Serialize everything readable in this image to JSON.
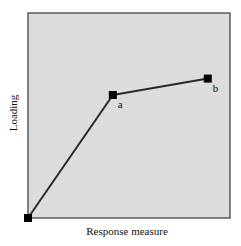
{
  "chart_data": {
    "type": "line",
    "title": "",
    "xlabel": "Response measure",
    "ylabel": "Loading",
    "xlim": [
      0,
      1
    ],
    "ylim": [
      0,
      1
    ],
    "grid": false,
    "legend": "none",
    "series": [
      {
        "name": "loading-path",
        "points": [
          {
            "x": 0.0,
            "y": 0.0,
            "label": ""
          },
          {
            "x": 0.42,
            "y": 0.6,
            "label": "a"
          },
          {
            "x": 0.89,
            "y": 0.68,
            "label": "b"
          }
        ]
      }
    ],
    "colors": {
      "background": "#dcdcdc",
      "frame": "#444444",
      "line": "#2a2a2a",
      "marker": "#000000"
    }
  }
}
